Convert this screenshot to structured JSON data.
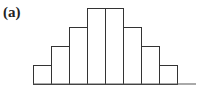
{
  "panel_label": "(a)",
  "chart_data": {
    "type": "bar",
    "title": "",
    "xlabel": "",
    "ylabel": "",
    "categories": [
      "1",
      "2",
      "3",
      "4",
      "5",
      "6",
      "7",
      "8"
    ],
    "values": [
      1,
      2,
      3,
      4,
      4,
      3,
      2,
      1
    ],
    "ylim": [
      0,
      4
    ],
    "grid": false,
    "legend": null
  },
  "colors": {
    "bar_fill": "#ffffff",
    "bar_stroke": "#333333",
    "axis": "#555555"
  }
}
